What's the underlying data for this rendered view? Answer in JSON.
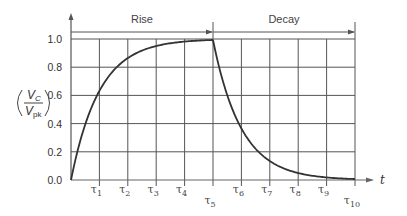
{
  "chart_data": {
    "type": "line",
    "title": "",
    "xlabel": "t",
    "ylabel": "(V_C / V_pk)",
    "ylabel_parts": {
      "num": "V",
      "num_sub": "C",
      "den": "V",
      "den_sub": "pk"
    },
    "x_tick_labels": [
      "τ1",
      "τ2",
      "τ3",
      "τ4",
      "τ5",
      "τ6",
      "τ7",
      "τ8",
      "τ9",
      "τ10"
    ],
    "x_ticks": [
      {
        "base": "τ",
        "sub": "1"
      },
      {
        "base": "τ",
        "sub": "2"
      },
      {
        "base": "τ",
        "sub": "3"
      },
      {
        "base": "τ",
        "sub": "4"
      },
      {
        "base": "τ",
        "sub": "5"
      },
      {
        "base": "τ",
        "sub": "6"
      },
      {
        "base": "τ",
        "sub": "7"
      },
      {
        "base": "τ",
        "sub": "8"
      },
      {
        "base": "τ",
        "sub": "9"
      },
      {
        "base": "τ",
        "sub": "10"
      }
    ],
    "y_tick_labels": [
      "0.0",
      "0.2",
      "0.4",
      "0.6",
      "0.8",
      "1.0"
    ],
    "ylim": [
      0,
      1.0
    ],
    "xlim": [
      0,
      10
    ],
    "grid": true,
    "annotations": [
      {
        "label": "Rise",
        "x_from": 0,
        "x_to": 5
      },
      {
        "label": "Decay",
        "x_from": 5,
        "x_to": 10
      }
    ],
    "series": [
      {
        "name": "Rise",
        "x": [
          0,
          0.5,
          1,
          1.5,
          2,
          2.5,
          3,
          3.5,
          4,
          4.5,
          5
        ],
        "values": [
          0,
          0.39,
          0.63,
          0.78,
          0.86,
          0.92,
          0.95,
          0.97,
          0.98,
          0.99,
          0.99
        ]
      },
      {
        "name": "Decay",
        "x": [
          5,
          5.5,
          6,
          6.5,
          7,
          7.5,
          8,
          8.5,
          9,
          9.5,
          10
        ],
        "values": [
          0.99,
          0.61,
          0.37,
          0.22,
          0.14,
          0.08,
          0.05,
          0.03,
          0.02,
          0.01,
          0.0
        ]
      }
    ]
  }
}
